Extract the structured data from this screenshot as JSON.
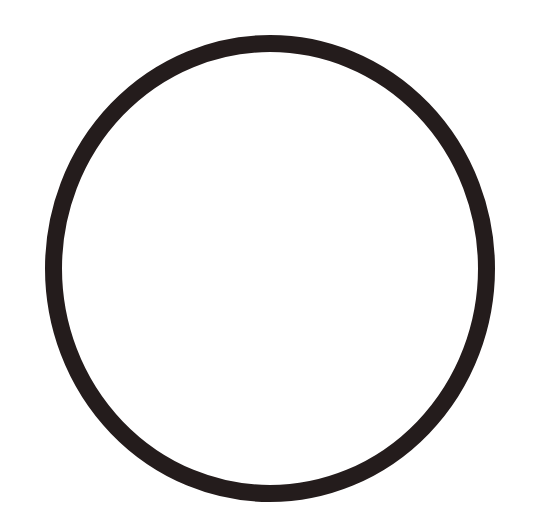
{
  "shape": {
    "type": "ring",
    "stroke_color": "#241c1c",
    "background_color": "#ffffff",
    "center": [
      270,
      268.5
    ],
    "outer_radii": [
      225,
      233.5
    ],
    "stroke_width": 17
  }
}
